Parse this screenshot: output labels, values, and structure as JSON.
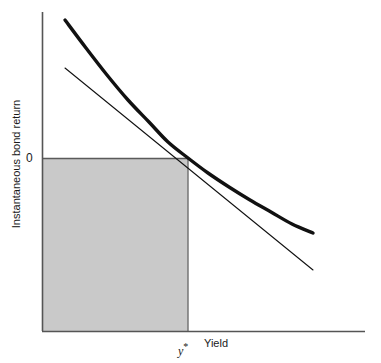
{
  "chart_data": {
    "type": "line",
    "title": "",
    "subtitle": "",
    "xlabel": "Yield",
    "ylabel": "Instantaneous bond return",
    "grid": false,
    "legend": null,
    "xlim": [
      0,
      100
    ],
    "ylim": [
      -100,
      100
    ],
    "axes": {
      "x_axis_visible": true,
      "y_axis_visible": true,
      "x_tick_labels": [
        "y*"
      ],
      "y_tick_labels": [
        "0"
      ]
    },
    "annotations": [
      {
        "name": "zero-tick-label",
        "text": "0",
        "x": 0,
        "y": 0
      },
      {
        "name": "ystar-tick-label",
        "text": "y",
        "superscript": "*",
        "x": 45,
        "y": -100
      },
      {
        "name": "x-axis-title",
        "text": "Yield"
      },
      {
        "name": "y-axis-title",
        "text": "Instantaneous bond return"
      }
    ],
    "series": [
      {
        "name": "price-yield-curve",
        "style": "thick-convex-curve",
        "stroke": "#111111",
        "stroke_width": 3.4,
        "points": [
          [
            65,
            20
          ],
          [
            86,
            48
          ],
          [
            107,
            75
          ],
          [
            128,
            100
          ],
          [
            149,
            122
          ],
          [
            168,
            142
          ],
          [
            188,
            158
          ],
          [
            208,
            173
          ],
          [
            229,
            187
          ],
          [
            250,
            200
          ],
          [
            271,
            212
          ],
          [
            292,
            224
          ],
          [
            313,
            233
          ]
        ]
      },
      {
        "name": "duration-tangent-line",
        "style": "thin-straight-line",
        "stroke": "#111111",
        "stroke_width": 1.1,
        "points": [
          [
            65,
            68
          ],
          [
            313,
            270
          ]
        ]
      }
    ],
    "shapes": [
      {
        "name": "zero-return-shaded-region",
        "type": "rectangle",
        "x0": 42,
        "y0": 158,
        "x1": 188,
        "y1": 331,
        "fill": "#c9c9c9",
        "stroke": "#6e6e6e",
        "stroke_width": 1.2
      },
      {
        "name": "zero-reference-line",
        "type": "line",
        "x0": 42,
        "y0": 158,
        "x1": 188,
        "y1": 158,
        "stroke": "#5a5a5a",
        "stroke_width": 1.2
      }
    ],
    "tangency_point": {
      "name": "tangency-point",
      "x": 188,
      "y": 158,
      "label": "y*"
    },
    "colors": {
      "background": "#ffffff",
      "axis": "#555555",
      "curve": "#111111",
      "tangent": "#111111",
      "shaded_region": "#c9c9c9",
      "shaded_region_border": "#6e6e6e",
      "text": "#1a1a1a"
    },
    "geometry": {
      "y_axis_x": 42,
      "y_axis_top": 12,
      "x_axis_y": 331,
      "x_axis_right": 365,
      "zero_level_y": 158
    }
  }
}
